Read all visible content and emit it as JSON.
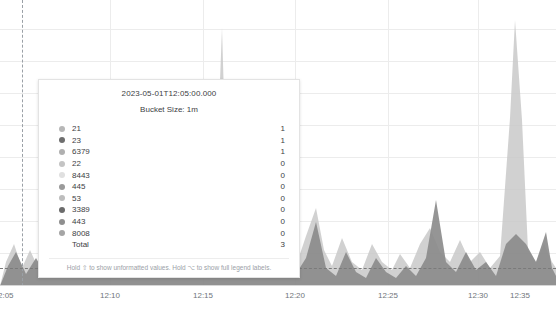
{
  "chart_data": {
    "type": "area",
    "title": "",
    "xlabel": "",
    "ylabel": "",
    "stacked": true,
    "grid": true,
    "legend_position": "tooltip",
    "xlim": [
      "12:05",
      "12:38"
    ],
    "ylim": [
      0,
      10
    ],
    "x_ticks": [
      "2:05",
      "12:10",
      "12:15",
      "12:20",
      "12:25",
      "12:30",
      "12:35"
    ],
    "x_tick_positions": [
      10,
      110,
      203,
      295,
      388,
      478,
      520
    ],
    "hover_x": "12:05",
    "series": [
      {
        "name": "21",
        "color": "#b7b7b7",
        "value_at_hover": 1
      },
      {
        "name": "23",
        "color": "#6e6e6e",
        "value_at_hover": 1
      },
      {
        "name": "6379",
        "color": "#b0b0b0",
        "value_at_hover": 1
      },
      {
        "name": "22",
        "color": "#c4c4c4",
        "value_at_hover": 0
      },
      {
        "name": "8443",
        "color": "#e0e0e0",
        "value_at_hover": 0
      },
      {
        "name": "445",
        "color": "#9a9a9a",
        "value_at_hover": 0
      },
      {
        "name": "53",
        "color": "#bdbdbd",
        "value_at_hover": 0
      },
      {
        "name": "3389",
        "color": "#6b6b6b",
        "value_at_hover": 0
      },
      {
        "name": "443",
        "color": "#8f8f8f",
        "value_at_hover": 0
      },
      {
        "name": "8008",
        "color": "#a5a5a5",
        "value_at_hover": 0
      }
    ],
    "total_label": "Total",
    "total_value": 3,
    "areas": [
      {
        "name": "light-band",
        "color": "#c9c9c9",
        "opacity": 0.85,
        "points": "0,286 6,262 14,244 22,268 30,250 40,272 50,246 58,268 68,258 78,272 88,252 98,268 108,258 118,272 128,256 138,270 148,260 158,274 168,258 178,268 188,262 198,272 206,266 214,240 222,28 228,236 236,264 246,256 256,270 266,258 276,268 286,254 296,266 306,236 316,208 324,250 332,266 342,238 352,262 362,270 372,244 382,262 392,270 400,254 410,268 420,244 430,228 440,252 450,262 460,240 470,262 480,252 490,268 500,256 510,118 515,20 522,120 528,250 536,262 544,244 552,262 556,268 556,286 0,286"
      },
      {
        "name": "dark-band",
        "color": "#8a8a8a",
        "opacity": 0.9,
        "points": "0,286 8,266 16,252 26,274 36,258 46,276 56,256 66,274 76,264 86,276 96,262 106,276 116,266 126,278 136,264 146,276 156,268 166,278 176,266 186,274 196,270 206,278 216,272 226,262 236,276 246,268 256,278 266,268 276,276 286,264 296,274 306,258 316,222 326,268 336,276 346,252 356,272 366,278 376,258 386,272 396,278 406,266 416,276 426,258 436,200 446,262 456,272 466,252 476,270 486,262 496,276 506,244 516,234 526,244 536,262 546,232 552,268 556,276 556,286 0,286"
      }
    ]
  },
  "tooltip": {
    "timestamp": "2023-05-01T12:05:00.000",
    "bucket_size": "Bucket Size: 1m",
    "footer": "Hold ⇧ to show unformatted values. Hold ⌥ to show full legend labels."
  }
}
